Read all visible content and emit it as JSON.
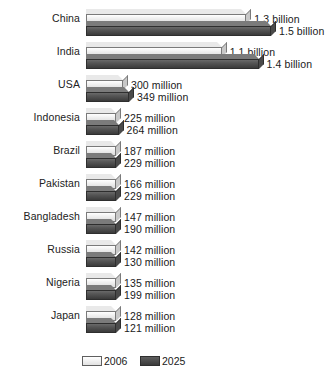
{
  "chart_data": {
    "type": "bar",
    "title": "",
    "subtitle": "",
    "xlabel": "",
    "ylabel": "",
    "orientation": "horizontal",
    "grid": false,
    "legend_position": "bottom",
    "categories": [
      "China",
      "India",
      "USA",
      "Indonesia",
      "Brazil",
      "Pakistan",
      "Bangladesh",
      "Russia",
      "Nigeria",
      "Japan"
    ],
    "unit": "millions of people",
    "xlim": [
      0,
      1600
    ],
    "series": [
      {
        "name": "2006",
        "color": "#f0f0f0",
        "values": [
          1300,
          1100,
          300,
          225,
          187,
          166,
          147,
          142,
          135,
          128
        ],
        "labels": [
          "1.3 billion",
          "1.1 billion",
          "300 million",
          "225 million",
          "187 million",
          "166 million",
          "147 million",
          "142 million",
          "135 million",
          "128 million"
        ]
      },
      {
        "name": "2025",
        "color": "#4a4a4a",
        "values": [
          1500,
          1400,
          349,
          264,
          229,
          229,
          190,
          130,
          199,
          121
        ],
        "labels": [
          "1.5 billion",
          "1.4 billion",
          "349 million",
          "264 million",
          "229 million",
          "229 million",
          "190 million",
          "130 million",
          "199 million",
          "121 million"
        ]
      }
    ]
  },
  "legend": {
    "items": [
      {
        "label": "2006",
        "swatch": "light-swatch"
      },
      {
        "label": "2025",
        "swatch": "dark-swatch"
      }
    ]
  }
}
